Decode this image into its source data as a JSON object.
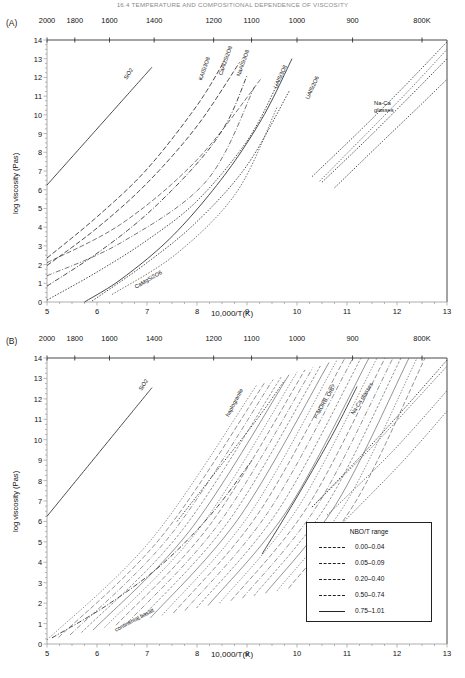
{
  "header": {
    "running_head": "16.4 TEMPERATURE AND COMPOSITIONAL DEPENDENCE OF VISCOSITY"
  },
  "panels": [
    {
      "tag": "(A)",
      "top_axis_labels": [
        "2000",
        "1800",
        "1600",
        "1400",
        "1200",
        "1100",
        "1000",
        "900",
        "800K"
      ],
      "xlabel": "10,000/T(K)",
      "ylabel": "log viscosity (Pas)",
      "xticks": [
        "5",
        "6",
        "7",
        "8",
        "9",
        "10",
        "11",
        "12",
        "13"
      ],
      "yticks": [
        "0",
        "1",
        "2",
        "3",
        "4",
        "5",
        "6",
        "7",
        "8",
        "9",
        "10",
        "11",
        "12",
        "13",
        "14"
      ],
      "curve_labels": [
        "SiO2",
        "KAlSi3O8",
        "CaAl2Si2O8",
        "NaAlSi3O8",
        "LiAlSi3O8",
        "LiAlSi2O6",
        "CaMgSi2O6"
      ],
      "block_labels": [
        "Na-Ca",
        "glasses"
      ]
    },
    {
      "tag": "(B)",
      "top_axis_labels": [
        "2000",
        "1800",
        "1600",
        "1400",
        "1200",
        "1100",
        "1000",
        "900",
        "800K"
      ],
      "xlabel": "10,000/T(K)",
      "ylabel": "log viscosity (Pas)",
      "xticks": [
        "5",
        "6",
        "7",
        "8",
        "9",
        "10",
        "11",
        "12",
        "13"
      ],
      "yticks": [
        "0",
        "1",
        "2",
        "3",
        "4",
        "5",
        "6",
        "7",
        "8",
        "9",
        "10",
        "11",
        "12",
        "13",
        "14"
      ],
      "curve_labels": [
        "SiO2",
        "haplogranite",
        "P-MORB, OIB?",
        "Na-Ca glasses",
        "continental basalt"
      ],
      "legend": {
        "title": "NBO/T range",
        "items": [
          {
            "label": "0.00–0.04",
            "dash": "0.6 1.4 3 1.4"
          },
          {
            "label": "0.05–0.09",
            "dash": "4 1.8"
          },
          {
            "label": "0.20–0.40",
            "dash": "1.3 1.3"
          },
          {
            "label": "0.50–0.74",
            "dash": "4 1.5 0.7 1.5"
          },
          {
            "label": "0.75–1.01",
            "dash": "0"
          }
        ]
      }
    }
  ],
  "chart_data": [
    {
      "type": "line",
      "panel": "(A)",
      "title": "",
      "xlabel": "10,000/T(K)",
      "ylabel": "log viscosity (Pas)",
      "xlim": [
        5,
        13
      ],
      "ylim": [
        0,
        14
      ],
      "grid": false,
      "legend_position": "none",
      "secondary_axis": {
        "name": "Temperature (K)",
        "position": "top",
        "ticks": [
          {
            "label": "2000",
            "x": 5.0
          },
          {
            "label": "1800",
            "x": 5.556
          },
          {
            "label": "1600",
            "x": 6.25
          },
          {
            "label": "1400",
            "x": 7.143
          },
          {
            "label": "1200",
            "x": 8.333
          },
          {
            "label": "1100",
            "x": 9.091
          },
          {
            "label": "1000",
            "x": 10.0
          },
          {
            "label": "900",
            "x": 11.111
          },
          {
            "label": "800K",
            "x": 12.5
          }
        ]
      },
      "series": [
        {
          "name": "SiO2",
          "style": "solid",
          "x": [
            5.0,
            5.6,
            6.2,
            6.8,
            7.1
          ],
          "y": [
            6.25,
            8.05,
            9.85,
            11.65,
            12.55
          ]
        },
        {
          "name": "KAlSi3O8",
          "style": "dashed",
          "x": [
            5.0,
            6.0,
            7.0,
            8.0,
            8.55
          ],
          "y": [
            2.35,
            4.55,
            7.1,
            10.5,
            12.9
          ]
        },
        {
          "name": "CaAl2Si2O8",
          "style": "dashed",
          "x": [
            5.0,
            6.0,
            7.0,
            8.0,
            8.85
          ],
          "y": [
            1.95,
            3.95,
            6.35,
            9.4,
            12.8
          ]
        },
        {
          "name": "NaAlSi3O8",
          "style": "dash-dot",
          "x": [
            5.0,
            6.0,
            7.0,
            8.0,
            8.6,
            9.0
          ],
          "y": [
            0.85,
            2.6,
            4.7,
            7.4,
            9.6,
            12.1
          ]
        },
        {
          "name": "LiAlSi3O8",
          "style": "dotted",
          "x": [
            5.0,
            6.0,
            7.0,
            8.0,
            9.0,
            9.6
          ],
          "y": [
            0.1,
            1.6,
            3.3,
            5.4,
            8.6,
            11.6
          ]
        },
        {
          "name": "LiAlSi2O6",
          "style": "dotted",
          "x": [
            5.9,
            7.0,
            8.0,
            9.0,
            9.85
          ],
          "y": [
            0.05,
            2.1,
            4.3,
            7.3,
            11.3
          ]
        },
        {
          "name": "CaMgSi2O6",
          "style": "solid",
          "x": [
            5.75,
            6.5,
            7.5,
            8.5,
            9.3,
            9.9
          ],
          "y": [
            0.0,
            1.25,
            3.5,
            6.6,
            9.8,
            13.0
          ]
        },
        {
          "name": "Na-Ca glasses 1",
          "style": "dotted",
          "x": [
            10.3,
            11.2,
            12.1,
            13.0
          ],
          "y": [
            6.7,
            9.0,
            11.4,
            13.9
          ]
        },
        {
          "name": "Na-Ca glasses 2",
          "style": "dotted",
          "x": [
            10.5,
            11.4,
            12.3,
            13.0
          ],
          "y": [
            6.4,
            8.7,
            11.1,
            13.0
          ]
        },
        {
          "name": "Na-Ca glasses 3",
          "style": "dotted",
          "x": [
            10.75,
            11.6,
            12.5,
            13.0
          ],
          "y": [
            6.1,
            8.3,
            10.6,
            11.9
          ]
        }
      ]
    },
    {
      "type": "line",
      "panel": "(B)",
      "title": "",
      "xlabel": "10,000/T(K)",
      "ylabel": "log viscosity (Pas)",
      "xlim": [
        5,
        13
      ],
      "ylim": [
        0,
        14
      ],
      "grid": false,
      "legend_position": "lower-right",
      "legend_title": "NBO/T range",
      "secondary_axis": {
        "name": "Temperature (K)",
        "position": "top",
        "ticks": [
          {
            "label": "2000",
            "x": 5.0
          },
          {
            "label": "1800",
            "x": 5.556
          },
          {
            "label": "1600",
            "x": 6.25
          },
          {
            "label": "1400",
            "x": 7.143
          },
          {
            "label": "1200",
            "x": 8.333
          },
          {
            "label": "1100",
            "x": 9.091
          },
          {
            "label": "1000",
            "x": 10.0
          },
          {
            "label": "900",
            "x": 11.111
          },
          {
            "label": "800K",
            "x": 12.5
          }
        ]
      },
      "series": [
        {
          "name": "SiO2",
          "style": "solid",
          "x": [
            5.0,
            5.6,
            6.2,
            6.8,
            7.1
          ],
          "y": [
            6.25,
            8.05,
            9.85,
            11.65,
            12.55
          ]
        },
        {
          "name": "haplogranite",
          "style": "dotted",
          "x": [
            7.6,
            8.4,
            9.2,
            9.75
          ],
          "y": [
            6.0,
            8.5,
            11.0,
            12.9
          ]
        },
        {
          "name": "P-MORB, OIB?",
          "style": "solid",
          "x": [
            9.3,
            10.0,
            10.7,
            11.2
          ],
          "y": [
            4.4,
            7.2,
            10.2,
            12.6
          ]
        },
        {
          "name": "Na-Ca glasses",
          "style": "dotted",
          "x": [
            10.3,
            11.2,
            12.1,
            13.0
          ],
          "y": [
            6.7,
            9.0,
            11.4,
            13.9
          ]
        },
        {
          "name": "continental basalt",
          "style": "dash-dot",
          "x": [
            5.1,
            6.2,
            7.3,
            8.3,
            9.1
          ],
          "y": [
            0.3,
            1.9,
            3.9,
            6.4,
            9.0
          ]
        }
      ]
    }
  ]
}
